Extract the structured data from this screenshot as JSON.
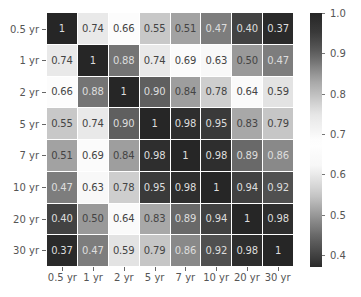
{
  "chart_data": {
    "type": "heatmap",
    "title": "",
    "xlabel": "",
    "ylabel": "",
    "x_categories": [
      "0.5 yr",
      "1 yr",
      "2 yr",
      "5 yr",
      "7 yr",
      "10 yr",
      "20 yr",
      "30 yr"
    ],
    "y_categories": [
      "0.5 yr",
      "1 yr",
      "2 yr",
      "5 yr",
      "7 yr",
      "10 yr",
      "20 yr",
      "30 yr"
    ],
    "values": [
      [
        1,
        0.74,
        0.66,
        0.55,
        0.51,
        0.47,
        0.4,
        0.37
      ],
      [
        0.74,
        1,
        0.88,
        0.74,
        0.69,
        0.63,
        0.5,
        0.47
      ],
      [
        0.66,
        0.88,
        1,
        0.9,
        0.84,
        0.78,
        0.64,
        0.59
      ],
      [
        0.55,
        0.74,
        0.9,
        1,
        0.98,
        0.95,
        0.83,
        0.79
      ],
      [
        0.51,
        0.69,
        0.84,
        0.98,
        1,
        0.98,
        0.89,
        0.86
      ],
      [
        0.47,
        0.63,
        0.78,
        0.95,
        0.98,
        1,
        0.94,
        0.92
      ],
      [
        0.4,
        0.5,
        0.64,
        0.83,
        0.89,
        0.94,
        1,
        0.98
      ],
      [
        0.37,
        0.47,
        0.59,
        0.79,
        0.86,
        0.92,
        0.98,
        1
      ]
    ],
    "value_labels": [
      [
        "1",
        "0.74",
        "0.66",
        "0.55",
        "0.51",
        "0.47",
        "0.40",
        "0.37"
      ],
      [
        "0.74",
        "1",
        "0.88",
        "0.74",
        "0.69",
        "0.63",
        "0.50",
        "0.47"
      ],
      [
        "0.66",
        "0.88",
        "1",
        "0.90",
        "0.84",
        "0.78",
        "0.64",
        "0.59"
      ],
      [
        "0.55",
        "0.74",
        "0.90",
        "1",
        "0.98",
        "0.95",
        "0.83",
        "0.79"
      ],
      [
        "0.51",
        "0.69",
        "0.84",
        "0.98",
        "1",
        "0.98",
        "0.89",
        "0.86"
      ],
      [
        "0.47",
        "0.63",
        "0.78",
        "0.95",
        "0.98",
        "1",
        "0.94",
        "0.92"
      ],
      [
        "0.40",
        "0.50",
        "0.64",
        "0.83",
        "0.89",
        "0.94",
        "1",
        "0.98"
      ],
      [
        "0.37",
        "0.47",
        "0.59",
        "0.79",
        "0.86",
        "0.92",
        "0.98",
        "1"
      ]
    ],
    "colorbar": {
      "ticks": [
        "1.0",
        "0.9",
        "0.8",
        "0.7",
        "0.6",
        "0.5",
        "0.4"
      ],
      "tick_values": [
        1.0,
        0.9,
        0.8,
        0.7,
        0.6,
        0.5,
        0.4
      ],
      "vmin": 0.37,
      "vmax": 1.0
    },
    "colormap_stops": [
      [
        0.37,
        "#2a2a2a"
      ],
      [
        0.45,
        "#6a6a6a"
      ],
      [
        0.55,
        "#c8c8c8"
      ],
      [
        0.62,
        "#f7f7f7"
      ],
      [
        0.68,
        "#ffffff"
      ],
      [
        0.75,
        "#e5e5e5"
      ],
      [
        0.83,
        "#a8a8a8"
      ],
      [
        0.9,
        "#5f5f5f"
      ],
      [
        0.95,
        "#3a3a3a"
      ],
      [
        1.0,
        "#262626"
      ]
    ],
    "annotated": true,
    "grid": false
  }
}
